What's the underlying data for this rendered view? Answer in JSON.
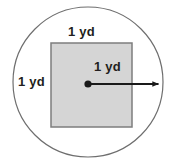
{
  "figure": {
    "background_color": "#ffffff",
    "circle": {
      "name": "outer-circle",
      "center_x": 88,
      "center_y": 82,
      "radius": 75,
      "stroke_color": "#6e6e6e",
      "stroke_width": 1.2,
      "fill": "none"
    },
    "square": {
      "name": "inner-square",
      "x": 51,
      "y": 43,
      "width": 81,
      "height": 84,
      "fill_color": "#d5d5d5",
      "stroke_color": "#7d7d7d",
      "stroke_width": 1.5
    },
    "center_point": {
      "name": "circle-center-dot",
      "x": 88,
      "y": 84,
      "radius": 3.6,
      "color": "#1a1a1a"
    },
    "radius_arrow": {
      "name": "radius-arrow",
      "from_x": 88,
      "from_y": 84,
      "to_x": 163,
      "to_y": 84,
      "color": "#1a1a1a",
      "stroke_width": 1.8,
      "arrowhead": "solid-triangle"
    },
    "labels": {
      "top": "1 yd",
      "left": "1 yd",
      "radius": "1 yd"
    },
    "text_color": "#231f20"
  }
}
